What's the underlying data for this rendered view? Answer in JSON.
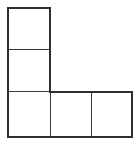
{
  "figure": {
    "shape_name": "L-pentomino",
    "cell_count": 5,
    "stroke_color": "#3a3a3a",
    "outline_color": "#2e2e2e",
    "fill_color": "#ffffff",
    "background_color": "#ffffff",
    "stroke_width_px": 1,
    "cell_size_px": 43,
    "origin": {
      "x": 7,
      "y": 7
    },
    "grid": {
      "columns": 3,
      "rows": 3,
      "occupancy": [
        [
          1,
          0,
          0
        ],
        [
          1,
          0,
          0
        ],
        [
          1,
          1,
          1
        ]
      ]
    },
    "cells": [
      {
        "id": "cell-r0c0",
        "label": "",
        "row": 0,
        "col": 0,
        "x": 7,
        "y": 7,
        "w": 44,
        "h": 43
      },
      {
        "id": "cell-r1c0",
        "label": "",
        "row": 1,
        "col": 0,
        "x": 7,
        "y": 49,
        "w": 44,
        "h": 43
      },
      {
        "id": "cell-r2c0",
        "label": "",
        "row": 2,
        "col": 0,
        "x": 7,
        "y": 91,
        "w": 44,
        "h": 47
      },
      {
        "id": "cell-r2c1",
        "label": "",
        "row": 2,
        "col": 1,
        "x": 50,
        "y": 91,
        "w": 42,
        "h": 47
      },
      {
        "id": "cell-r2c2",
        "label": "",
        "row": 2,
        "col": 2,
        "x": 91,
        "y": 91,
        "w": 42,
        "h": 47
      }
    ],
    "bounding_box": {
      "left": 7,
      "top": 7,
      "right": 133,
      "bottom": 138
    }
  }
}
